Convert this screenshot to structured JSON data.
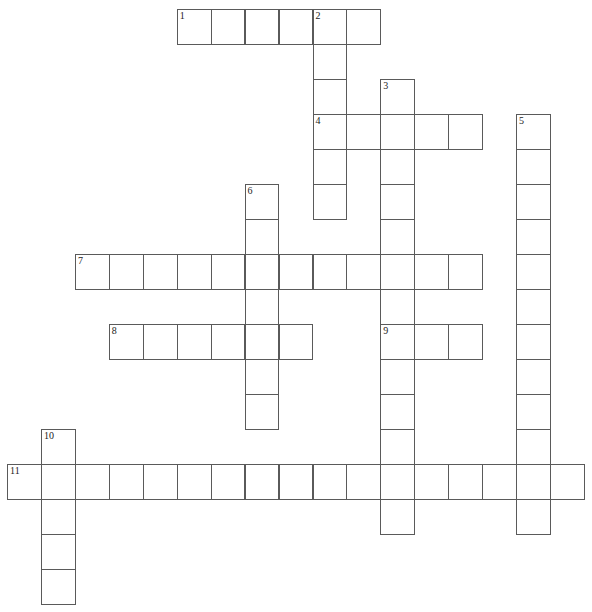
{
  "puzzle": {
    "origin_x": 7,
    "origin_y": 9,
    "cell_w": 33.94,
    "cell_h": 35,
    "border_color": "#5a5a5a",
    "words": [
      {
        "number": "1",
        "direction": "across",
        "row": 0,
        "col": 5,
        "length": 6
      },
      {
        "number": "2",
        "direction": "down",
        "row": 0,
        "col": 9,
        "length": 6
      },
      {
        "number": "3",
        "direction": "down",
        "row": 2,
        "col": 11,
        "length": 13
      },
      {
        "number": "4",
        "direction": "across",
        "row": 3,
        "col": 9,
        "length": 5
      },
      {
        "number": "5",
        "direction": "down",
        "row": 3,
        "col": 15,
        "length": 12
      },
      {
        "number": "6",
        "direction": "down",
        "row": 5,
        "col": 7,
        "length": 7
      },
      {
        "number": "7",
        "direction": "across",
        "row": 7,
        "col": 2,
        "length": 12
      },
      {
        "number": "8",
        "direction": "across",
        "row": 9,
        "col": 3,
        "length": 6
      },
      {
        "number": "9",
        "direction": "across",
        "row": 9,
        "col": 11,
        "length": 3
      },
      {
        "number": "10",
        "direction": "down",
        "row": 12,
        "col": 1,
        "length": 5
      },
      {
        "number": "11",
        "direction": "across",
        "row": 13,
        "col": 0,
        "length": 17
      }
    ]
  }
}
